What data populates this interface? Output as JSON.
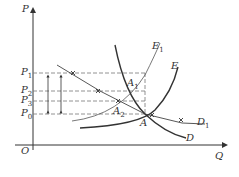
{
  "axes": {
    "y_label": "P",
    "x_label": "Q",
    "origin_label": "O"
  },
  "price_levels": [
    {
      "label": "P",
      "sub": "1"
    },
    {
      "label": "P",
      "sub": "2"
    },
    {
      "label": "P",
      "sub": "3"
    },
    {
      "label": "P",
      "sub": "0"
    }
  ],
  "curves": [
    {
      "label": "E",
      "sub": "1"
    },
    {
      "label": "E",
      "sub": ""
    },
    {
      "label": "D",
      "sub": "1"
    },
    {
      "label": "D",
      "sub": ""
    }
  ],
  "points": [
    {
      "label": "A",
      "sub": "1"
    },
    {
      "label": "A",
      "sub": "2"
    },
    {
      "label": "A",
      "sub": ""
    }
  ],
  "colors": {
    "line": "#333333",
    "dash": "#666666"
  }
}
